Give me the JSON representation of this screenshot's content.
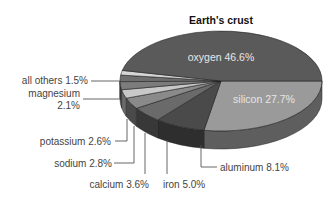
{
  "chart_data": {
    "type": "pie",
    "title": "Earth's crust",
    "style": "3d",
    "slices": [
      {
        "label": "oxygen",
        "value": 46.6,
        "display": "oxygen 46.6%",
        "color": "#5a5a5a",
        "side": "#454545"
      },
      {
        "label": "silicon",
        "value": 27.7,
        "display": "silicon 27.7%",
        "color": "#9a9a9a",
        "side": "#5e5e5e"
      },
      {
        "label": "aluminum",
        "value": 8.1,
        "display": "aluminum 8.1%",
        "color": "#4a4a4a",
        "side": "#2e2e2e"
      },
      {
        "label": "iron",
        "value": 5.0,
        "display": "iron 5.0%",
        "color": "#6a6a6a",
        "side": "#383838"
      },
      {
        "label": "calcium",
        "value": 3.6,
        "display": "calcium 3.6%",
        "color": "#8a8a8a",
        "side": "#4a4a4a"
      },
      {
        "label": "sodium",
        "value": 2.8,
        "display": "sodium 2.8%",
        "color": "#c8c8c8",
        "side": "#6a6a6a"
      },
      {
        "label": "potassium",
        "value": 2.6,
        "display": "potassium 2.6%",
        "color": "#7c7c7c",
        "side": "#555555"
      },
      {
        "label": "magnesium",
        "value": 2.1,
        "display": "magnesium 2.1%",
        "color": "#6e6e6e",
        "side": "#4e4e4e"
      },
      {
        "label": "all others",
        "value": 1.5,
        "display": "all others 1.5%",
        "color": "#d6d6d6",
        "side": "#8a8a8a"
      }
    ],
    "unit": "%",
    "legend": "none (leader-line labels)"
  },
  "labels": {
    "title": "Earth's crust",
    "oxygen": "oxygen 46.6%",
    "silicon": "silicon 27.7%",
    "aluminum": "aluminum 8.1%",
    "iron": "iron 5.0%",
    "calcium": "calcium 3.6%",
    "sodium": "sodium 2.8%",
    "potassium": "potassium 2.6%",
    "magnesium_line1": "magnesium",
    "magnesium_line2": "2.1%",
    "all_others": "all others 1.5%"
  }
}
